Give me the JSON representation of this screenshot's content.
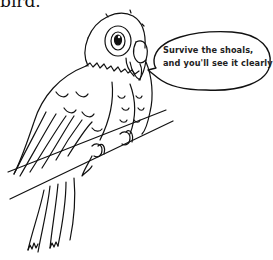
{
  "top_text": "bird.",
  "speech_bubble": {
    "lines": [
      "Survive the shoals,",
      "and you'll see it clearly!"
    ]
  },
  "illustration": {
    "subject": "parrot-on-branch",
    "style": "black-and-white line art",
    "colors": {
      "line": "#111111",
      "background": "#ffffff"
    }
  }
}
